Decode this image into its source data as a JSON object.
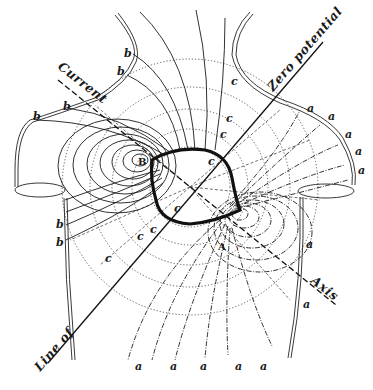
{
  "figure": {
    "colors": {
      "ink": "#1a1a1a",
      "background": "#ffffff"
    },
    "axis_labels": {
      "current_top": "Current",
      "axis_bottom": "Axis",
      "zero_top": "Zero potential",
      "zero_bottom": "Line of"
    },
    "points": {
      "B": "B",
      "A": "A"
    },
    "region_labels": {
      "b": [
        "b",
        "b",
        "b",
        "b",
        "b",
        "b"
      ],
      "a_right": [
        "a",
        "a",
        "a",
        "a",
        "a"
      ],
      "a_lower_right": [
        "a",
        "a"
      ],
      "a_bottom": [
        "a",
        "a",
        "a",
        "a",
        "a"
      ],
      "c": [
        "c",
        "c",
        "c",
        "c",
        "c",
        "c",
        "c",
        "c"
      ]
    }
  }
}
